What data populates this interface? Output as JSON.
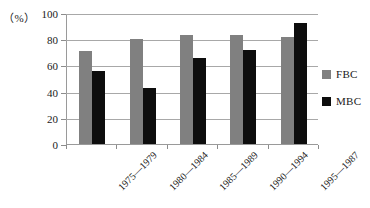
{
  "chart_data": {
    "type": "bar",
    "title": "",
    "xlabel": "",
    "ylabel": "(%)",
    "unit_label": "（%）",
    "ylim": [
      0,
      100
    ],
    "yticks": [
      0,
      20,
      40,
      60,
      80,
      100
    ],
    "ytick_labels": [
      "0",
      "20",
      "40",
      "60",
      "80",
      "100"
    ],
    "grid": true,
    "legend_position": "right",
    "categories": [
      "1975—1979",
      "1980—1984",
      "1985—1989",
      "1990—1994",
      "1995—1987"
    ],
    "series": [
      {
        "name": "FBC",
        "color": "#808080",
        "values": [
          71,
          80,
          83.5,
          83,
          82
        ]
      },
      {
        "name": "MBC",
        "color": "#0d0d0d",
        "values": [
          56,
          42.5,
          66,
          71.5,
          92
        ]
      }
    ]
  },
  "legend": {
    "items": [
      {
        "label": "FBC",
        "color": "#808080"
      },
      {
        "label": "MBC",
        "color": "#0d0d0d"
      }
    ]
  }
}
